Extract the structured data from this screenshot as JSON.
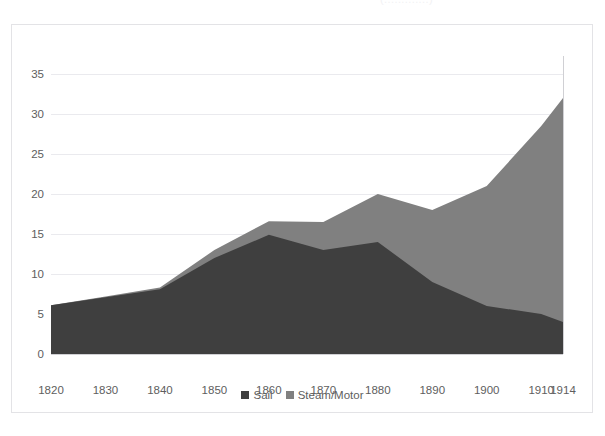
{
  "clipped_title": "(.............)",
  "colors": {
    "sail": "#3f3f3f",
    "steam": "#808080",
    "gridline": "#eaeaee",
    "axis": "#d0d0d4",
    "tick_text": "#5e5e5e",
    "frame_border": "#e3e3e6",
    "background": "#ffffff"
  },
  "legend": {
    "position": "bottom-center",
    "entries": [
      {
        "name": "sail-legend",
        "label": "Sail",
        "color": "#3f3f3f"
      },
      {
        "name": "steam-legend",
        "label": "Steam/Motor",
        "color": "#808080"
      }
    ]
  },
  "axes": {
    "y_ticks": [
      "0",
      "5",
      "10",
      "15",
      "20",
      "25",
      "30",
      "35"
    ],
    "x_ticks": [
      "1820",
      "1830",
      "1840",
      "1850",
      "1860",
      "1870",
      "1880",
      "1890",
      "1900",
      "1910",
      "1914"
    ]
  },
  "chart_data": {
    "type": "area",
    "stacked": true,
    "title": "",
    "subtitle": "",
    "xlabel": "",
    "ylabel": "",
    "xlim": [
      1820,
      1914
    ],
    "ylim": [
      0,
      35
    ],
    "grid": true,
    "legend_position": "bottom",
    "categories": [
      1820,
      1830,
      1840,
      1850,
      1860,
      1870,
      1880,
      1890,
      1900,
      1910,
      1914
    ],
    "x": [
      1820,
      1830,
      1840,
      1850,
      1860,
      1870,
      1880,
      1890,
      1900,
      1910,
      1914
    ],
    "series": [
      {
        "name": "Sail",
        "color": "#3f3f3f",
        "values": [
          6.1,
          7.1,
          8.1,
          12.0,
          14.9,
          13.0,
          14.0,
          9.0,
          6.0,
          5.0,
          4.0
        ]
      },
      {
        "name": "Steam/Motor",
        "color": "#808080",
        "values": [
          0.0,
          0.1,
          0.2,
          1.0,
          1.7,
          3.5,
          6.0,
          9.0,
          15.0,
          23.5,
          28.0
        ]
      }
    ],
    "totals": [
      6.1,
      7.2,
      8.3,
      13.0,
      16.6,
      16.5,
      20.0,
      18.0,
      21.0,
      28.5,
      32.0
    ]
  }
}
